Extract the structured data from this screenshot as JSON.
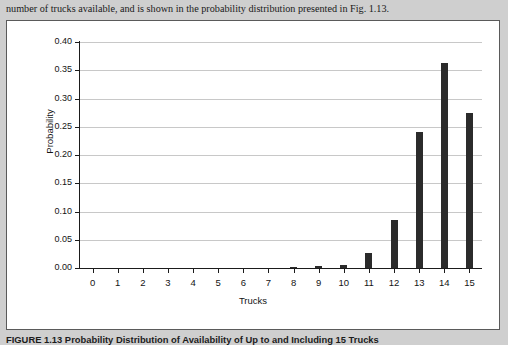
{
  "body_text": "number of trucks available, and is shown in the probability distribution presented in Fig. 1.13.",
  "caption": "FIGURE 1.13  Probability Distribution  of Availability  of Up to and  Including 15 Trucks",
  "chart_data": {
    "type": "bar",
    "title": "",
    "xlabel": "Trucks",
    "ylabel": "Probability",
    "categories": [
      "0",
      "1",
      "2",
      "3",
      "4",
      "5",
      "6",
      "7",
      "8",
      "9",
      "10",
      "11",
      "12",
      "13",
      "14",
      "15"
    ],
    "values": [
      0.0,
      0.0,
      0.0,
      0.0,
      0.0,
      0.0,
      0.0,
      0.0,
      0.002,
      0.003,
      0.006,
      0.027,
      0.085,
      0.241,
      0.363,
      0.274
    ],
    "ylim": [
      0.0,
      0.4
    ],
    "yticks": [
      "0.00",
      "0.05",
      "0.10",
      "0.15",
      "0.20",
      "0.25",
      "0.30",
      "0.35",
      "0.40"
    ],
    "ytick_values": [
      0.0,
      0.05,
      0.1,
      0.15,
      0.2,
      0.25,
      0.3,
      0.35,
      0.4
    ],
    "grid": true,
    "legend": "none",
    "bar_color": "#2b2b2b",
    "grid_color": "#c8c8c8",
    "axis_color": "#1b1b1b"
  }
}
